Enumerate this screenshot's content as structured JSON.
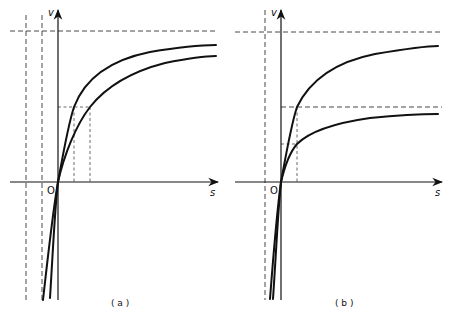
{
  "figure": {
    "panels": [
      {
        "id": "a",
        "caption": "( a )",
        "y_axis_label": "v",
        "x_axis_label": "s",
        "origin_label": "O",
        "description": "Two hyperbolic saturation curves sharing the same asymptotic maximum (horizontal dashed line) but different half-saturation constants (two vertical dashed lines left of origin)."
      },
      {
        "id": "b",
        "caption": "( b )",
        "y_axis_label": "v",
        "x_axis_label": "s",
        "origin_label": "O",
        "description": "Two hyperbolic saturation curves sharing the same half-saturation constant (single vertical dashed line left of origin) but different asymptotic maxima (two horizontal dashed lines)."
      }
    ]
  }
}
